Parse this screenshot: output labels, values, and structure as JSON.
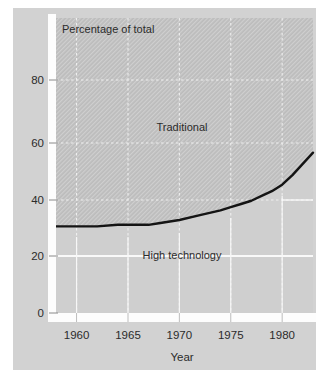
{
  "chart_data": {
    "type": "area",
    "title": "",
    "header_note": "Percentage of total",
    "xlabel": "Year",
    "ylabel": "",
    "xlim": [
      1958,
      1983
    ],
    "ylim": [
      0,
      92
    ],
    "xticks": [
      1960,
      1965,
      1970,
      1975,
      1980
    ],
    "xtick_labels": [
      "1960",
      "1965",
      "1970",
      "1975",
      "1980"
    ],
    "yticks": [
      0,
      20,
      40,
      60,
      80
    ],
    "ytick_labels": [
      "0",
      "20",
      "40",
      "60",
      "80"
    ],
    "grid": true,
    "legend_position": "inline-annotations",
    "series": [
      {
        "name": "High technology",
        "label_text": "High technology",
        "fill": "lower",
        "x": [
          1958,
          1960,
          1962,
          1964,
          1966,
          1967,
          1968,
          1970,
          1972,
          1974,
          1975,
          1976,
          1977,
          1978,
          1979,
          1980,
          1981,
          1982,
          1983
        ],
        "values": [
          27,
          27,
          27,
          27.5,
          27.5,
          27.5,
          28,
          29,
          30.5,
          32,
          33,
          34,
          35,
          36.5,
          38,
          40,
          43,
          46.5,
          50
        ]
      },
      {
        "name": "Traditional",
        "label_text": "Traditional",
        "fill": "upper-hatched",
        "x": [
          1958,
          1960,
          1962,
          1964,
          1966,
          1967,
          1968,
          1970,
          1972,
          1974,
          1975,
          1976,
          1977,
          1978,
          1979,
          1980,
          1981,
          1982,
          1983
        ],
        "values": [
          73,
          73,
          73,
          72.5,
          72.5,
          72.5,
          72,
          71,
          69.5,
          68,
          67,
          66,
          65,
          63.5,
          62,
          60,
          57,
          53.5,
          50
        ]
      }
    ],
    "annotations": [
      {
        "text": "Traditional",
        "x": 1970.2,
        "y": 62
      },
      {
        "text": "High technology",
        "x": 1969.8,
        "y": 22
      },
      {
        "text": "Percentage of total",
        "x": 1958.8,
        "y": 88
      }
    ],
    "colors": {
      "figure_background": "#ffffff",
      "panel_background": "#d2d2d2",
      "lower_region": "#cfcfcf",
      "upper_region_hatch_base": "#bdbdbd",
      "upper_region_hatch_line": "#cccccc",
      "gridline": "#f2f2f2",
      "data_line": "#111111",
      "axis_spine": "#ffffff",
      "text": "#2b2b2b"
    }
  }
}
